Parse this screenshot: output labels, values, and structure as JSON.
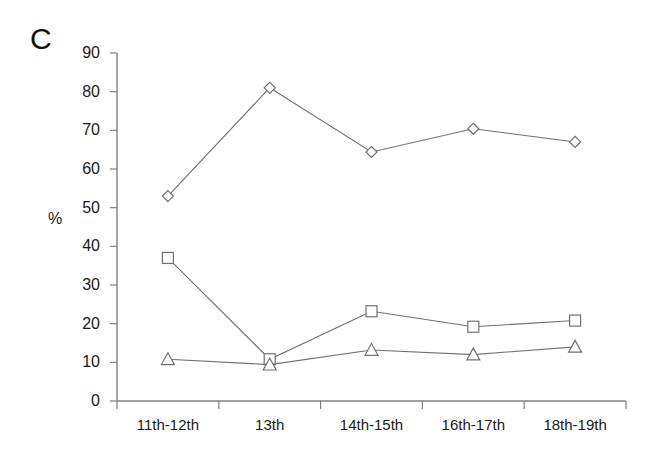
{
  "figure": {
    "panel_label": "C",
    "background_color": "#ffffff",
    "axis_color": "#808080",
    "series_color": "#707070",
    "marker_fill": "#ffffff"
  },
  "chart_data": {
    "type": "line",
    "title": "C",
    "xlabel": "",
    "ylabel": "%",
    "categories": [
      "11th-12th",
      "13th",
      "14th-15th",
      "16th-17th",
      "18th-19th"
    ],
    "ylim": [
      0,
      90
    ],
    "ytick_values": [
      0,
      10,
      20,
      30,
      40,
      50,
      60,
      70,
      80,
      90
    ],
    "ytick_labels": [
      "0",
      "10",
      "20",
      "30",
      "40",
      "50",
      "60",
      "70",
      "80",
      "90"
    ],
    "grid": false,
    "legend": "none",
    "series": [
      {
        "name": "diamond-series",
        "marker": "diamond",
        "values": [
          53,
          81,
          64.4,
          70.4,
          67
        ]
      },
      {
        "name": "square-series",
        "marker": "square",
        "values": [
          37,
          10.8,
          23.2,
          19.2,
          20.8
        ]
      },
      {
        "name": "triangle-series",
        "marker": "triangle",
        "values": [
          10.8,
          9.4,
          13.2,
          12,
          14
        ]
      }
    ]
  }
}
